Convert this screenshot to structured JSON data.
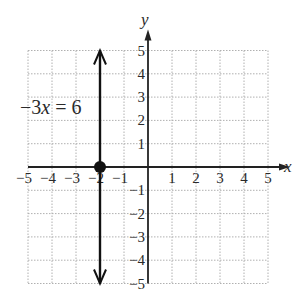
{
  "chart_data": {
    "type": "line",
    "title": "",
    "xlabel": "x",
    "ylabel": "y",
    "xlim": [
      -5,
      5
    ],
    "ylim": [
      -5,
      5
    ],
    "grid": true,
    "x_ticks": [
      "-5",
      "-4",
      "-3",
      "-2",
      "-1",
      "1",
      "2",
      "3",
      "4",
      "5"
    ],
    "y_ticks": [
      "5",
      "4",
      "3",
      "2",
      "1",
      "-1",
      "-2",
      "-3",
      "-4",
      "-5"
    ],
    "series": [
      {
        "name": "-3x = 6",
        "description": "vertical line x = -2",
        "x": [
          -2,
          -2
        ],
        "y": [
          -5,
          5
        ],
        "arrows": "both"
      }
    ],
    "points": [
      {
        "x": -2,
        "y": 0,
        "label": "x-intercept"
      }
    ],
    "annotations": [
      {
        "text": "-3x = 6",
        "x": -5,
        "y": 2.5
      }
    ]
  },
  "labels": {
    "equation_coef": "−3",
    "equation_var": "x",
    "equation_rest": " = 6",
    "x_axis": "x",
    "y_axis": "y"
  },
  "colors": {
    "grid": "#b0b0b0",
    "axis": "#222222",
    "line": "#111111",
    "text": "#2a2a2a"
  }
}
